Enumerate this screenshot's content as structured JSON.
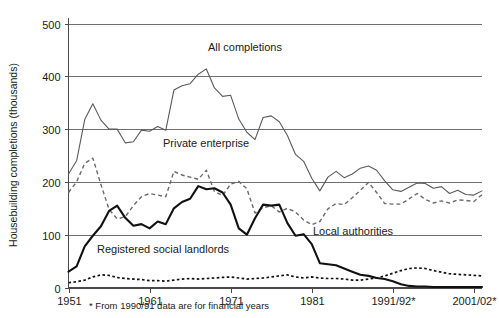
{
  "chart_data": {
    "type": "line",
    "title": "",
    "xlabel": "",
    "ylabel": "Housebuilding completions (thousands)",
    "ylim": [
      0,
      500
    ],
    "ytick_values": [
      0,
      100,
      200,
      300,
      400,
      500
    ],
    "ytick_labels": [
      "0",
      "100",
      "200",
      "300",
      "400",
      "500"
    ],
    "grid": "horizontal",
    "legend_position": "inline-annotations",
    "footnote": "* From 1990/91 data are for financial years",
    "xtick_labels": [
      "1951",
      "1961",
      "1971",
      "1981",
      "1991/92*",
      "2001/02*"
    ],
    "xtick_years": [
      1951,
      1961,
      1971,
      1981,
      1991,
      2001
    ],
    "x_start": 1951,
    "x_end": 2002,
    "x": [
      1951,
      1952,
      1953,
      1954,
      1955,
      1956,
      1957,
      1958,
      1959,
      1960,
      1961,
      1962,
      1963,
      1964,
      1965,
      1966,
      1967,
      1968,
      1969,
      1970,
      1971,
      1972,
      1973,
      1974,
      1975,
      1976,
      1977,
      1978,
      1979,
      1980,
      1981,
      1982,
      1983,
      1984,
      1985,
      1986,
      1987,
      1988,
      1989,
      1990,
      1991,
      1992,
      1993,
      1994,
      1995,
      1996,
      1997,
      1998,
      1999,
      2000,
      2001,
      2002
    ],
    "series": [
      {
        "name": "All completions",
        "style": "thin-solid",
        "color": "#5a5a5a",
        "label_text": "All completions",
        "values": [
          215,
          240,
          318,
          348,
          317,
          300,
          300,
          274,
          276,
          298,
          296,
          305,
          298,
          374,
          382,
          386,
          404,
          414,
          378,
          362,
          364,
          319,
          294,
          280,
          322,
          325,
          314,
          288,
          252,
          239,
          207,
          183,
          209,
          220,
          208,
          215,
          226,
          230,
          222,
          202,
          185,
          182,
          190,
          198,
          197,
          188,
          191,
          178,
          184,
          176,
          175,
          183
        ]
      },
      {
        "name": "Private enterprise",
        "style": "dashed",
        "color": "#6a6a6a",
        "label_text": "Private enterprise",
        "values": [
          180,
          200,
          235,
          245,
          195,
          148,
          130,
          134,
          155,
          172,
          178,
          175,
          172,
          220,
          213,
          209,
          205,
          222,
          182,
          174,
          196,
          201,
          187,
          141,
          151,
          155,
          143,
          150,
          143,
          128,
          119,
          125,
          149,
          159,
          157,
          170,
          184,
          199,
          180,
          159,
          158,
          158,
          168,
          178,
          167,
          160,
          164,
          160,
          166,
          165,
          163,
          176
        ]
      },
      {
        "name": "Local authorities",
        "style": "thick-solid",
        "color": "#111111",
        "label_text": "Local authorities",
        "values": [
          30,
          40,
          78,
          98,
          116,
          145,
          155,
          132,
          117,
          120,
          112,
          125,
          120,
          150,
          162,
          168,
          192,
          186,
          188,
          180,
          157,
          112,
          100,
          131,
          157,
          155,
          157,
          122,
          98,
          101,
          82,
          46,
          44,
          42,
          36,
          30,
          24,
          22,
          18,
          16,
          12,
          6,
          3,
          2,
          2,
          1,
          1,
          1,
          1,
          1,
          1,
          1
        ]
      },
      {
        "name": "Registered social landlords",
        "style": "dotted",
        "color": "#111111",
        "label_text": "Registered social landlords",
        "values": [
          9,
          11,
          14,
          20,
          24,
          23,
          19,
          17,
          16,
          15,
          13,
          13,
          12,
          14,
          16,
          17,
          16,
          17,
          18,
          19,
          20,
          18,
          16,
          17,
          18,
          20,
          22,
          24,
          20,
          18,
          20,
          18,
          17,
          17,
          16,
          14,
          14,
          16,
          18,
          22,
          27,
          32,
          36,
          37,
          36,
          32,
          29,
          26,
          25,
          24,
          23,
          22
        ]
      }
    ],
    "annotations": [
      {
        "text": "All completions",
        "x_px": 208,
        "y_px": 51
      },
      {
        "text": "Private enterprise",
        "x_px": 163,
        "y_px": 147
      },
      {
        "text": "Local authorities",
        "x_px": 313,
        "y_px": 235
      },
      {
        "text": "Registered social landlords",
        "x_px": 97,
        "y_px": 253
      }
    ]
  }
}
